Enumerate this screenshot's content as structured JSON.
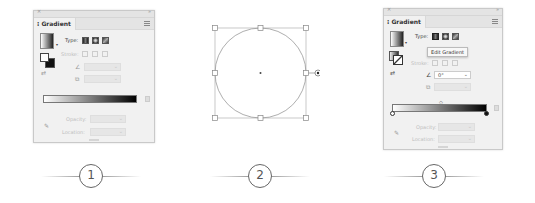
{
  "panels": [
    {
      "tab_title": "Gradient",
      "type_label": "Type:",
      "type_options": [
        "linear-gradient-icon",
        "radial-gradient-icon",
        "freeform-gradient-icon"
      ],
      "stroke_label": "Stroke:",
      "opacity_label": "Opacity:",
      "location_label": "Location:"
    },
    {
      "tab_title": "Gradient",
      "type_label": "Type:",
      "tooltip": "Edit Gradient",
      "stroke_label": "Stroke:",
      "angle_value": "0°",
      "opacity_label": "Opacity:",
      "location_label": "Location:"
    }
  ],
  "steps": [
    "1",
    "2",
    "3"
  ],
  "colors": {
    "panel_bg": "#f1f1f1",
    "gradient_start": "#ffffff",
    "gradient_end": "#000000"
  }
}
